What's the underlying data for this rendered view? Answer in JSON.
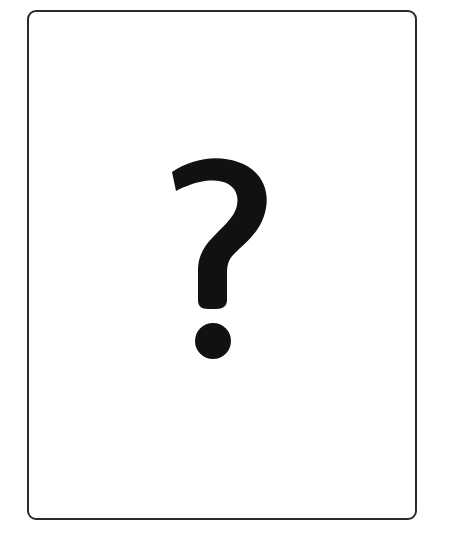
{
  "card": {
    "symbol": "?",
    "icon": "question-mark-icon",
    "border_color": "#2b2b2b",
    "symbol_color": "#111111"
  }
}
